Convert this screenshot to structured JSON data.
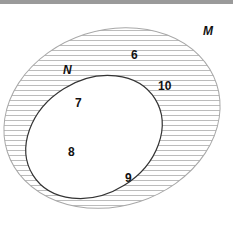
{
  "figure": {
    "type": "venn-diagram",
    "background_color": "#ffffff",
    "top_bar_color": "#9a9a9a"
  },
  "sets": {
    "outer": {
      "name": "M",
      "label": "M",
      "shape": "ellipse",
      "fill": "hatched",
      "hatch_color": "#b9b9b9",
      "hatch_spacing": 5,
      "stroke_color": "#a8a8a8",
      "stroke_width": 1,
      "center_x": 112,
      "center_y": 118,
      "radius_x": 110,
      "radius_y": 88,
      "rotation_deg": -18
    },
    "inner": {
      "name": "N",
      "label": "N",
      "shape": "ellipse",
      "fill": "#ffffff",
      "stroke_color": "#333333",
      "stroke_width": 1.2,
      "center_x": 94,
      "center_y": 137,
      "radius_x": 72,
      "radius_y": 57,
      "rotation_deg": -32
    }
  },
  "elements": [
    {
      "value": "6",
      "region": "M-only"
    },
    {
      "value": "10",
      "region": "M-only"
    },
    {
      "value": "7",
      "region": "N"
    },
    {
      "value": "8",
      "region": "N"
    },
    {
      "value": "9",
      "region": "N"
    }
  ],
  "labels": {
    "outer_set": "M",
    "inner_set": "N",
    "num_6": "6",
    "num_10": "10",
    "num_7": "7",
    "num_8": "8",
    "num_9": "9"
  },
  "colors": {
    "text": "#111111",
    "outer_stroke": "#a8a8a8",
    "inner_stroke": "#333333",
    "hatch": "#b9b9b9",
    "top_bar": "#9a9a9a"
  }
}
